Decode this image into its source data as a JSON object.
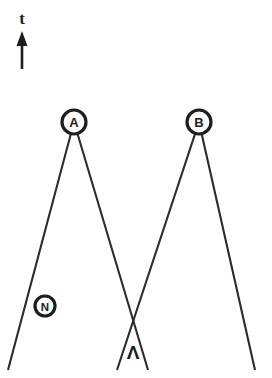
{
  "diagram": {
    "background_color": "#ffffff",
    "line_color": "#2b2b2b",
    "marker_color": "#1d1d1d",
    "axis": {
      "label": "t",
      "icon": "up-arrow-icon",
      "direction": "up",
      "meaning": "time"
    },
    "nodes": [
      {
        "id": "A",
        "label": "A",
        "x": 74,
        "y": 122,
        "radius": 12
      },
      {
        "id": "B",
        "label": "B",
        "x": 199,
        "y": 122,
        "radius": 12
      },
      {
        "id": "N",
        "label": "N",
        "x": 45,
        "y": 306,
        "radius": 10
      }
    ],
    "symbols": [
      {
        "id": "lambda",
        "label": "Λ",
        "x": 133,
        "y": 352
      }
    ],
    "paths": [
      {
        "id": "peak-a",
        "label": "A",
        "points": [
          [
            8,
            370
          ],
          [
            74,
            122
          ],
          [
            148,
            370
          ]
        ]
      },
      {
        "id": "peak-b",
        "label": "B",
        "points": [
          [
            117,
            370
          ],
          [
            199,
            122
          ],
          [
            255,
            370
          ]
        ]
      }
    ],
    "crossing_point": {
      "x": 133,
      "y": 305
    }
  }
}
